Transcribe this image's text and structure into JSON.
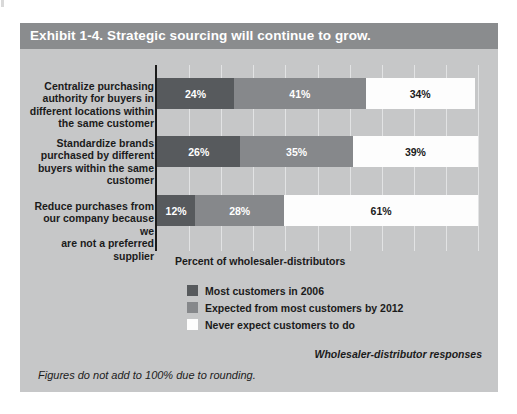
{
  "exhibit": {
    "title": "Exhibit 1-4. Strategic sourcing will continue to grow.",
    "axis_caption": "Percent of wholesaler-distributors",
    "source_note": "Wholesaler-distributor responses",
    "footnote": "Figures do not add to 100% due to rounding.",
    "colors": {
      "panel_background": "#c6c7c8",
      "title_bar": "#8a8c8e",
      "series_dark": "#575a5d",
      "series_mid": "#86888b",
      "series_light": "#fdfdfd",
      "gridline": "#e2e3e4",
      "axis": "#1b1b1b",
      "text": "#1b1b1b",
      "title_text": "#ffffff"
    }
  },
  "chart_data": {
    "type": "bar",
    "orientation": "horizontal",
    "stacked": true,
    "title": "Exhibit 1-4. Strategic sourcing will continue to grow.",
    "subtitle": "",
    "xlabel": "Percent of wholesaler-distributors",
    "ylabel": "",
    "xlim": [
      0,
      100
    ],
    "grid": true,
    "xticks": [
      0,
      10,
      20,
      30,
      40,
      50,
      60,
      70,
      80,
      90,
      100
    ],
    "xtick_labels": [],
    "legend_position": "below-axis-left",
    "categories": [
      "Centralize purchasing authority for buyers in different locations within the same customer",
      "Standardize brands purchased by different buyers within the same customer",
      "Reduce purchases from our company because we are not a preferred supplier"
    ],
    "series": [
      {
        "name": "Most customers in 2006",
        "color": "#575a5d",
        "values": [
          24,
          26,
          12
        ],
        "labels": [
          "24%",
          "26%",
          "12%"
        ]
      },
      {
        "name": "Expected from most customers by 2012",
        "color": "#86888b",
        "values": [
          41,
          35,
          28
        ],
        "labels": [
          "41%",
          "35%",
          "28%"
        ]
      },
      {
        "name": "Never expect customers to do",
        "color": "#fdfdfd",
        "values": [
          34,
          39,
          61
        ],
        "labels": [
          "34%",
          "39%",
          "61%"
        ]
      }
    ],
    "annotations": [
      "Wholesaler-distributor responses",
      "Figures do not add to 100% due to rounding."
    ]
  },
  "category_labels": [
    {
      "lines": [
        "Centralize purchasing",
        "authority for buyers in",
        "different locations within",
        "the same customer"
      ]
    },
    {
      "lines": [
        "Standardize brands",
        "purchased by different",
        "buyers within the same",
        "customer"
      ]
    },
    {
      "lines": [
        "Reduce purchases from",
        "our company because we",
        "are not a preferred supplier"
      ]
    }
  ],
  "legend": {
    "items": [
      {
        "label": "Most customers in 2006",
        "swatch": "dark"
      },
      {
        "label": "Expected from most customers by 2012",
        "swatch": "mid"
      },
      {
        "label": "Never expect customers to do",
        "swatch": "light"
      }
    ]
  }
}
